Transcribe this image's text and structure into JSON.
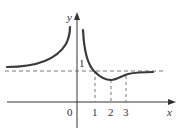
{
  "diagram": {
    "type": "function-graph",
    "axes": {
      "x_label": "x",
      "y_label": "y",
      "origin_label": "0"
    },
    "x_ticks": [
      "1",
      "2",
      "3"
    ],
    "y_ticks": [
      "1"
    ],
    "asymptotes": {
      "horizontal": "y = 1",
      "vertical": "x = 0"
    },
    "colors": {
      "curve": "#3a3a3a",
      "axes": "#333333",
      "dashed": "#555555"
    }
  }
}
